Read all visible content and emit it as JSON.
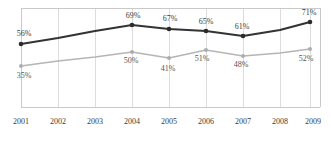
{
  "chart_data": {
    "type": "line",
    "title": "",
    "subtitle": "",
    "xlabel": "",
    "ylabel": "",
    "categories": [
      "2001",
      "2002",
      "2003",
      "2004",
      "2005",
      "2006",
      "2007",
      "2008",
      "2009"
    ],
    "ylim": [
      0,
      80
    ],
    "xlim": [
      "2001",
      "2009"
    ],
    "grid": true,
    "grid_orientation": "vertical",
    "legend": "none",
    "value_suffix": "%",
    "series": [
      {
        "name": "series-dark",
        "color": "#333333",
        "marker": "circle",
        "values": [
          56,
          null,
          null,
          69,
          67,
          65,
          61,
          null,
          71
        ],
        "labels": [
          "56%",
          "",
          "",
          "69%",
          "67%",
          "65%",
          "61%",
          "",
          "71%"
        ],
        "labeled_categories": [
          "2001",
          "2004",
          "2005",
          "2006",
          "2007",
          "2009"
        ]
      },
      {
        "name": "series-gray",
        "color": "#b5b5b5",
        "marker": "circle",
        "values": [
          35,
          null,
          null,
          50,
          41,
          51,
          48,
          null,
          52
        ],
        "labels": [
          "35%",
          "",
          "",
          "50%",
          "41%",
          "51%",
          "48%",
          "",
          "52%"
        ],
        "labeled_categories": [
          "2001",
          "2004",
          "2005",
          "2006",
          "2007",
          "2009"
        ]
      }
    ],
    "points": [
      {
        "category": "2001",
        "x": 21,
        "dark_y": 44,
        "gray_y": 66,
        "dark_label": "56%",
        "gray_label": "35%",
        "dark_label_x": 24,
        "dark_label_y": 36,
        "gray_label_x": 24,
        "gray_label_y": 78,
        "marker": true
      },
      {
        "category": "2002",
        "x": 58,
        "dark_y": 38,
        "gray_y": 61,
        "dark_label": "",
        "gray_label": "",
        "marker": false
      },
      {
        "category": "2003",
        "x": 95,
        "dark_y": 31,
        "gray_y": 57,
        "dark_label": "",
        "gray_label": "",
        "marker": false
      },
      {
        "category": "2004",
        "x": 132,
        "dark_y": 25,
        "gray_y": 52,
        "dark_label": "69%",
        "gray_label": "50%",
        "dark_label_x": 133,
        "dark_label_y": 18,
        "gray_label_x": 131,
        "gray_label_y": 63,
        "marker": true
      },
      {
        "category": "2005",
        "x": 169,
        "dark_y": 29,
        "gray_y": 58,
        "dark_label": "67%",
        "gray_label": "41%",
        "dark_label_x": 170,
        "dark_label_y": 21,
        "gray_label_x": 168,
        "gray_label_y": 71,
        "marker": true
      },
      {
        "category": "2006",
        "x": 206,
        "dark_y": 31,
        "gray_y": 50,
        "dark_label": "65%",
        "gray_label": "51%",
        "dark_label_x": 206,
        "dark_label_y": 24,
        "gray_label_x": 202,
        "gray_label_y": 61,
        "marker": true
      },
      {
        "category": "2007",
        "x": 243,
        "dark_y": 36,
        "gray_y": 56,
        "dark_label": "61%",
        "gray_label": "48%",
        "dark_label_x": 242,
        "dark_label_y": 29,
        "gray_label_x": 241,
        "gray_label_y": 67,
        "marker": true
      },
      {
        "category": "2008",
        "x": 280,
        "dark_y": 30,
        "gray_y": 53,
        "dark_label": "",
        "gray_label": "",
        "marker": false
      },
      {
        "category": "2009",
        "x": 310,
        "dark_y": 22,
        "gray_y": 49,
        "dark_label": "71%",
        "gray_label": "52%",
        "dark_label_x": 309,
        "dark_label_y": 15,
        "gray_label_x": 306,
        "gray_label_y": 61,
        "marker": true
      }
    ],
    "axis_tick_labels": [
      {
        "label": "2001",
        "x": 21,
        "y": 124
      },
      {
        "label": "2002",
        "x": 58,
        "y": 124
      },
      {
        "label": "2003",
        "x": 95,
        "y": 124
      },
      {
        "label": "2004",
        "x": 132,
        "y": 124
      },
      {
        "label": "2005",
        "x": 169,
        "y": 124
      },
      {
        "label": "2006",
        "x": 206,
        "y": 124
      },
      {
        "label": "2007",
        "x": 243,
        "y": 124
      },
      {
        "label": "2008",
        "x": 280,
        "y": 124
      },
      {
        "label": "2009",
        "x": 313,
        "y": 124
      }
    ],
    "gridline_x": [
      21,
      58,
      95,
      132,
      169,
      206,
      243,
      280,
      310
    ],
    "plot_box": {
      "left": 21,
      "right": 320,
      "top": 8,
      "bottom": 107
    }
  },
  "colors": {
    "series_dark": "#333333",
    "series_gray": "#b5b5b5",
    "grid": "#dcdcdc",
    "axis": "#c9c9c9",
    "label_text": "#3a3a3a",
    "background": "#ffffff"
  }
}
